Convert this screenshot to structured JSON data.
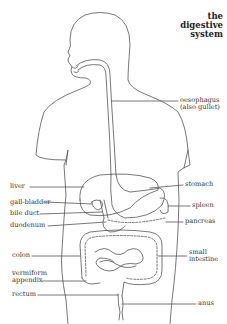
{
  "title": {
    "line1": "the",
    "line2": "digestive",
    "line3": "system"
  },
  "labels_left": [
    {
      "id": "liver",
      "text": "liver"
    },
    {
      "id": "gall-bladder",
      "text": "gall-bladder"
    },
    {
      "id": "bile-duct",
      "text": "bile duct"
    },
    {
      "id": "duodenum",
      "text": "duodenum"
    },
    {
      "id": "colon",
      "text": "colon"
    },
    {
      "id": "vermiform-appendix",
      "line1": "vermiform",
      "line2": "appendix"
    },
    {
      "id": "rectum",
      "text": "rectum"
    }
  ],
  "labels_right": [
    {
      "id": "oesophagus",
      "line1": "oesophagus",
      "line2": "(also gullet)"
    },
    {
      "id": "stomach",
      "text": "stomach"
    },
    {
      "id": "spleen",
      "text": "spleen"
    },
    {
      "id": "pancreas",
      "text": "pancreas"
    },
    {
      "id": "small-intestine",
      "line1": "small",
      "line2": "intestine"
    },
    {
      "id": "anus",
      "text": "anus"
    }
  ],
  "colors": {
    "line": "#555555",
    "text": "#333333",
    "background": "#ffffff"
  }
}
